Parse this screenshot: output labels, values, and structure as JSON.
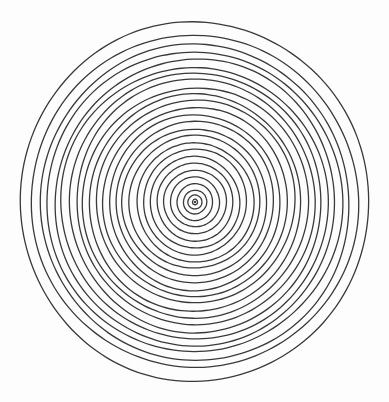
{
  "figure": {
    "kind": "concentric-circles-diagram",
    "style": "hand-drawn ink line drawing",
    "background_color": "#fdfdfd",
    "stroke_color": "#3a3a3a",
    "stroke_width": 1.3,
    "canvas": {
      "width": 389,
      "height": 402
    }
  },
  "chart_data": {
    "type": "scatter",
    "subtitle": "",
    "xlabel": "",
    "ylabel": "",
    "grid": false,
    "legend": null,
    "xlim": [
      0,
      389
    ],
    "ylim": [
      0,
      402
    ],
    "center": {
      "x": 195,
      "y": 202
    },
    "ring_count": 26,
    "radial_spacing": 6.85,
    "outer_radius_x": 175,
    "outer_radius_y": 179,
    "aspect_ratio": 1.0229,
    "center_dot_radius": 1.2,
    "rings": [
      {
        "index": 1,
        "rx": 2.6,
        "ry": 2.7
      },
      {
        "index": 2,
        "rx": 6.9,
        "ry": 7.1
      },
      {
        "index": 3,
        "rx": 11.6,
        "ry": 11.9
      },
      {
        "index": 4,
        "rx": 17.9,
        "ry": 18.3
      },
      {
        "index": 5,
        "rx": 24.4,
        "ry": 25.0
      },
      {
        "index": 6,
        "rx": 31.2,
        "ry": 31.9
      },
      {
        "index": 7,
        "rx": 38.0,
        "ry": 38.9
      },
      {
        "index": 8,
        "rx": 44.8,
        "ry": 45.8
      },
      {
        "index": 9,
        "rx": 51.6,
        "ry": 52.8
      },
      {
        "index": 10,
        "rx": 58.4,
        "ry": 59.7
      },
      {
        "index": 11,
        "rx": 65.2,
        "ry": 66.7
      },
      {
        "index": 12,
        "rx": 72.0,
        "ry": 73.6
      },
      {
        "index": 13,
        "rx": 78.8,
        "ry": 80.6
      },
      {
        "index": 14,
        "rx": 85.6,
        "ry": 87.5
      },
      {
        "index": 15,
        "rx": 92.4,
        "ry": 94.5
      },
      {
        "index": 16,
        "rx": 99.2,
        "ry": 101.4
      },
      {
        "index": 17,
        "rx": 106.0,
        "ry": 108.4
      },
      {
        "index": 18,
        "rx": 112.8,
        "ry": 115.4
      },
      {
        "index": 19,
        "rx": 119.6,
        "ry": 122.3
      },
      {
        "index": 20,
        "rx": 126.4,
        "ry": 129.3
      },
      {
        "index": 21,
        "rx": 133.2,
        "ry": 136.2
      },
      {
        "index": 22,
        "rx": 140.0,
        "ry": 143.2
      },
      {
        "index": 23,
        "rx": 147.2,
        "ry": 150.5
      },
      {
        "index": 24,
        "rx": 154.5,
        "ry": 158.0
      },
      {
        "index": 25,
        "rx": 163.0,
        "ry": 166.7
      },
      {
        "index": 26,
        "rx": 175.0,
        "ry": 179.0
      }
    ]
  }
}
